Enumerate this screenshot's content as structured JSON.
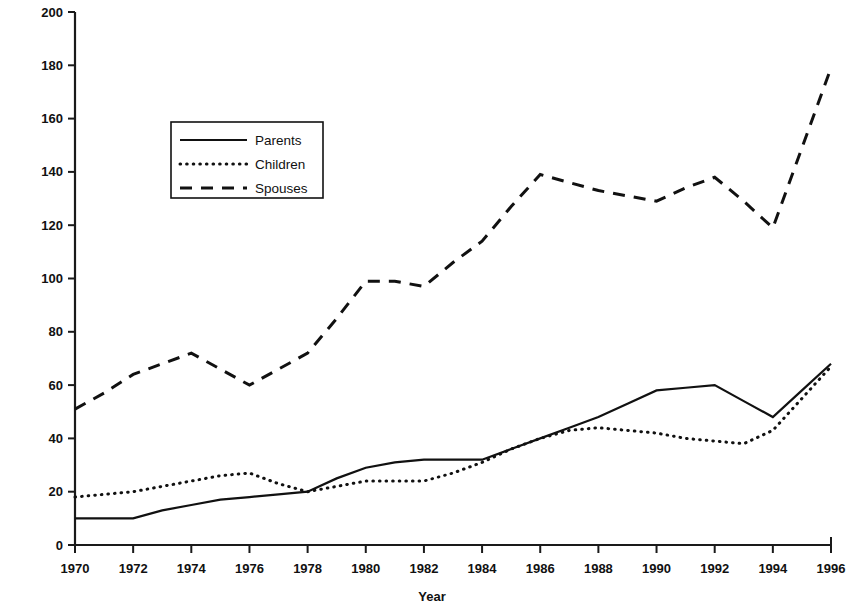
{
  "chart_data": {
    "type": "line",
    "title": "",
    "xlabel": "Year",
    "ylabel": "",
    "xlim": [
      1970,
      1996
    ],
    "ylim": [
      0,
      200
    ],
    "grid": false,
    "legend_position": "upper-left-inside",
    "x": [
      1970,
      1971,
      1972,
      1973,
      1974,
      1975,
      1976,
      1977,
      1978,
      1979,
      1980,
      1981,
      1982,
      1983,
      1984,
      1985,
      1986,
      1987,
      1988,
      1989,
      1990,
      1991,
      1992,
      1993,
      1994,
      1995,
      1996
    ],
    "xticks": [
      1970,
      1972,
      1974,
      1976,
      1978,
      1980,
      1982,
      1984,
      1986,
      1988,
      1990,
      1992,
      1994,
      1996
    ],
    "xtick_labels": [
      "1970",
      "1972",
      "1974",
      "1976",
      "1978",
      "1980",
      "1982",
      "1984",
      "1986",
      "1988",
      "1990",
      "1992",
      "1994",
      "1996"
    ],
    "yticks": [
      0,
      20,
      40,
      60,
      80,
      100,
      120,
      140,
      160,
      180,
      200
    ],
    "ytick_labels": [
      "0",
      "20",
      "40",
      "60",
      "80",
      "100",
      "120",
      "140",
      "160",
      "180",
      "200"
    ],
    "series": [
      {
        "name": "Parents",
        "style": "solid",
        "values": [
          10,
          10,
          10,
          13,
          15,
          17,
          18,
          19,
          20,
          25,
          29,
          31,
          32,
          32,
          32,
          36,
          40,
          44,
          48,
          53,
          58,
          59,
          60,
          54,
          48,
          58,
          68
        ]
      },
      {
        "name": "Children",
        "style": "dotted",
        "values": [
          18,
          19,
          20,
          22,
          24,
          26,
          27,
          23,
          20,
          22,
          24,
          24,
          24,
          27,
          31,
          36,
          40,
          43,
          44,
          43,
          42,
          40,
          39,
          38,
          43,
          55,
          67
        ]
      },
      {
        "name": "Spouses",
        "style": "dashed",
        "values": [
          51,
          57,
          64,
          68,
          72,
          66,
          60,
          66,
          72,
          85,
          99,
          99,
          97,
          106,
          114,
          127,
          139,
          136,
          133,
          131,
          129,
          134,
          138,
          129,
          119,
          149,
          179
        ]
      }
    ],
    "legend": [
      {
        "label": "Parents",
        "style": "solid"
      },
      {
        "label": "Children",
        "style": "dotted"
      },
      {
        "label": "Spouses",
        "style": "dashed"
      }
    ]
  }
}
